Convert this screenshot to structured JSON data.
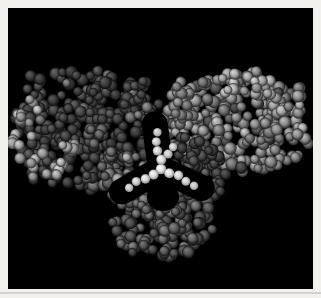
{
  "figure": {
    "canvas": {
      "width": 321,
      "height": 298
    },
    "frame": {
      "outer_color": "#f2f1ee",
      "inner_color": "#000000",
      "inset": {
        "left": 8,
        "top": 8,
        "right": 8,
        "bottom": 9
      },
      "shadow_line": {
        "y": 292,
        "height": 2,
        "color": "rgba(120,120,120,0.25)"
      }
    },
    "palettes": {
      "dark": {
        "base": "#0c0c0c",
        "mid": "#3e3e3e",
        "hi": "#5c5c5c"
      },
      "light": {
        "base": "#242424",
        "mid": "#7c7c7c",
        "hi": "#a9a9a9"
      },
      "bright": {
        "base": "#2e2e2e",
        "mid": "#989898",
        "hi": "#c0c0c0"
      },
      "medium": {
        "base": "#141414",
        "mid": "#606060",
        "hi": "#868686"
      },
      "dim": {
        "base": "#101010",
        "mid": "#4c4c4c",
        "hi": "#6a6a6a"
      },
      "core": {
        "base": "#8e8e8e",
        "mid": "#e6e6e6",
        "hi": "#ffffff"
      }
    },
    "clusters": [
      {
        "name": "left-domain",
        "cx": 86,
        "cy": 130,
        "rx": 75,
        "ry": 61,
        "rot": 6,
        "exp": 3,
        "count": 280,
        "rmin": 4.4,
        "rmax": 6.6,
        "colors": "dark",
        "seed": 7,
        "speckles": [
          {
            "p": 0.055,
            "colors": "medium"
          }
        ]
      },
      {
        "name": "right-domain",
        "cx": 236,
        "cy": 124,
        "rx": 74,
        "ry": 53,
        "rot": -8,
        "exp": 3,
        "count": 270,
        "rmin": 4.4,
        "rmax": 6.6,
        "colors": "light",
        "seed": 5,
        "speckles": [
          {
            "p": 0.1,
            "colors": "bright"
          },
          {
            "p": 0.1,
            "colors": "dim"
          }
        ]
      },
      {
        "name": "right-inner-shoulder",
        "cx": 181,
        "cy": 103,
        "rx": 13,
        "ry": 26,
        "rot": -10,
        "exp": 2,
        "count": 16,
        "rmin": 4.4,
        "rmax": 6.2,
        "colors": "light",
        "seed": 47
      },
      {
        "name": "left-inner-shoulder",
        "cx": 140,
        "cy": 104,
        "rx": 12,
        "ry": 24,
        "rot": 8,
        "exp": 2,
        "count": 14,
        "rmin": 4.4,
        "rmax": 6.2,
        "colors": "dark",
        "seed": 53,
        "speckles": [
          {
            "p": 0.2,
            "colors": "medium"
          }
        ]
      },
      {
        "name": "lower-right-shoulder",
        "cx": 198,
        "cy": 175,
        "rx": 31,
        "ry": 27,
        "rot": 10,
        "exp": 2.5,
        "count": 46,
        "rmin": 4.4,
        "rmax": 6.4,
        "colors": "dark",
        "seed": 31,
        "speckles": [
          {
            "p": 0.1,
            "colors": "dim"
          }
        ]
      },
      {
        "name": "lower-left-shoulder",
        "cx": 123,
        "cy": 176,
        "rx": 25,
        "ry": 26,
        "rot": 0,
        "exp": 2.5,
        "count": 38,
        "rmin": 4.4,
        "rmax": 6.4,
        "colors": "medium",
        "seed": 29,
        "speckles": [
          {
            "p": 0.16,
            "colors": "bright"
          }
        ]
      },
      {
        "name": "lower-domain",
        "cx": 162,
        "cy": 218,
        "rx": 54,
        "ry": 42,
        "rot": 0,
        "exp": 2.2,
        "count": 160,
        "rmin": 4.4,
        "rmax": 6.4,
        "colors": "dim",
        "seed": 37,
        "speckles": [
          {
            "p": 0.16,
            "colors": "medium"
          },
          {
            "p": 0.05,
            "colors": "dark"
          }
        ]
      },
      {
        "name": "left-edge-fringe",
        "cx": 25,
        "cy": 132,
        "rx": 13,
        "ry": 36,
        "rot": 14,
        "exp": 2,
        "count": 14,
        "rmin": 4.4,
        "rmax": 6.2,
        "colors": "bright",
        "seed": 13
      },
      {
        "name": "left-bottom-fringe",
        "cx": 58,
        "cy": 161,
        "rx": 34,
        "ry": 15,
        "rot": -16,
        "exp": 2,
        "count": 22,
        "rmin": 4.4,
        "rmax": 6.2,
        "colors": "bright",
        "seed": 17
      },
      {
        "name": "left-inner-light-patch",
        "cx": 99,
        "cy": 134,
        "rx": 13,
        "ry": 11,
        "rot": 0,
        "exp": 2,
        "count": 8,
        "rmin": 4.4,
        "rmax": 6.0,
        "colors": "medium",
        "seed": 19
      },
      {
        "name": "right-top-bright-patch",
        "cx": 247,
        "cy": 90,
        "rx": 36,
        "ry": 17,
        "rot": 6,
        "exp": 2,
        "count": 22,
        "rmin": 4.4,
        "rmax": 6.2,
        "colors": "bright",
        "seed": 23
      },
      {
        "name": "right-lower-dark-patch",
        "cx": 194,
        "cy": 149,
        "rx": 27,
        "ry": 14,
        "rot": 18,
        "exp": 2,
        "count": 14,
        "rmin": 4.4,
        "rmax": 6.2,
        "colors": "dark",
        "seed": 41
      },
      {
        "name": "lower-light-band",
        "cx": 149,
        "cy": 210,
        "rx": 32,
        "ry": 11,
        "rot": 6,
        "exp": 2,
        "count": 15,
        "rmin": 4.4,
        "rmax": 6.0,
        "colors": "medium",
        "seed": 43
      }
    ],
    "core": {
      "cx": 161,
      "cy": 169,
      "sphere_radius": 5.3,
      "arm_length": 37,
      "arm_sphere_count": 4,
      "arm_angles_deg": [
        -98,
        25,
        150
      ],
      "clear_width": 26,
      "clear_extra": 8,
      "clear_wedge": {
        "x": 163,
        "y": 197,
        "rx": 16,
        "ry": 14
      },
      "colors": "core",
      "extra_spheres": [
        {
          "x": 168,
          "y": 154,
          "r": 4.6
        },
        {
          "x": 173,
          "y": 147,
          "r": 4.2
        }
      ]
    }
  }
}
